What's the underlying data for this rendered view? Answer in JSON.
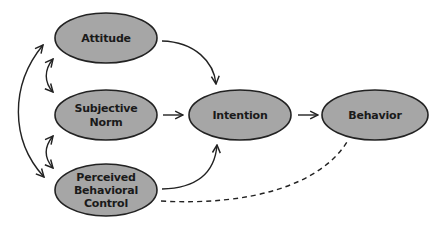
{
  "diagram": {
    "title": "",
    "nodes": {
      "attitude": {
        "lines": [
          "Attitude"
        ]
      },
      "subjective_norm": {
        "lines": [
          "Subjective",
          "Norm"
        ]
      },
      "pbc": {
        "lines": [
          "Perceived",
          "Behavioral",
          "Control"
        ]
      },
      "intention": {
        "lines": [
          "Intention"
        ]
      },
      "behavior": {
        "lines": [
          "Behavior"
        ]
      }
    },
    "edges": [
      {
        "from": "Attitude",
        "to": "Intention",
        "style": "solid",
        "arrow": "end"
      },
      {
        "from": "Subjective Norm",
        "to": "Intention",
        "style": "solid",
        "arrow": "end"
      },
      {
        "from": "Perceived Behavioral Control",
        "to": "Intention",
        "style": "solid",
        "arrow": "end"
      },
      {
        "from": "Intention",
        "to": "Behavior",
        "style": "solid",
        "arrow": "end"
      },
      {
        "from": "Perceived Behavioral Control",
        "to": "Behavior",
        "style": "dashed",
        "arrow": "none"
      },
      {
        "from": "Attitude",
        "to": "Subjective Norm",
        "style": "solid",
        "arrow": "both"
      },
      {
        "from": "Subjective Norm",
        "to": "Perceived Behavioral Control",
        "style": "solid",
        "arrow": "both"
      },
      {
        "from": "Attitude",
        "to": "Perceived Behavioral Control",
        "style": "solid",
        "arrow": "both"
      }
    ],
    "colors": {
      "node_fill": "#a6a6a6",
      "stroke": "#222222",
      "text": "#1a1a1a",
      "background": "#ffffff"
    }
  }
}
